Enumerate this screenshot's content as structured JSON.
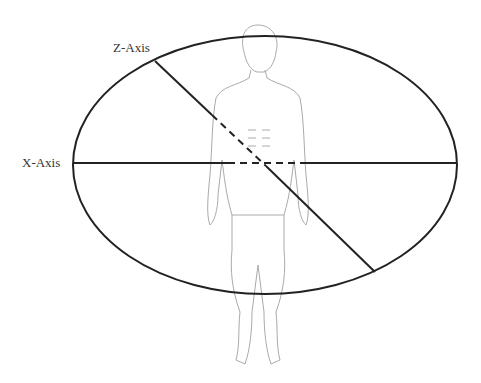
{
  "diagram": {
    "labels": {
      "z_axis": "Z-Axis",
      "x_axis": "X-Axis"
    },
    "plane": "transverse-ellipse",
    "colors": {
      "axis": "#222222",
      "figure": "#aaaaaa"
    }
  }
}
